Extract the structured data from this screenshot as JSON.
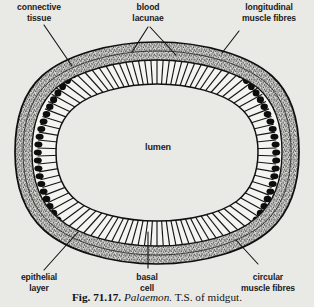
{
  "figure": {
    "title": "Palaemon. T.S. of midgut.",
    "background_color": "#e9e9e6",
    "ink_color": "#1b1b1b",
    "caption": {
      "fig_number": "Fig. 71.17.",
      "genus": "Palaemon.",
      "description": "T.S. of midgut."
    },
    "center_label": "lumen",
    "labels": [
      {
        "id": "connective-tissue",
        "text": "connective\ntissue",
        "position": "top-left"
      },
      {
        "id": "blood-lacunae",
        "text": "blood\nlacunae",
        "position": "top-center"
      },
      {
        "id": "longitudinal-muscle",
        "text": "longitudinal\nmuscle fibres",
        "position": "top-right"
      },
      {
        "id": "epithelial-layer",
        "text": "epithelial\nlayer",
        "position": "bottom-left"
      },
      {
        "id": "basal-cell",
        "text": "basal\ncell",
        "position": "bottom-center"
      },
      {
        "id": "circular-muscle",
        "text": "circular\nmuscle fibres",
        "position": "bottom-right"
      }
    ],
    "structure": {
      "shape": "oval transverse section",
      "layers": [
        "outer membrane line",
        "connective tissue (stippled)",
        "longitudinal muscle fibres",
        "circular muscle fibres",
        "blood lacunae",
        "columnar epithelial layer with nuclei",
        "basal cells",
        "lumen"
      ]
    }
  }
}
